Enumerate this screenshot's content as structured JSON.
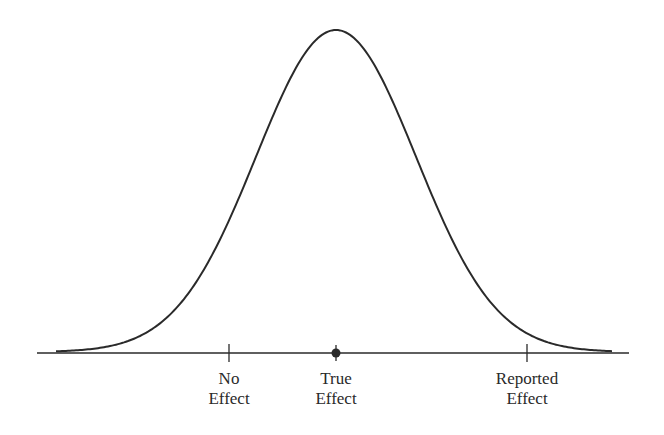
{
  "diagram": {
    "type": "normal-distribution-curve",
    "colors": {
      "line": "#2a2a2a",
      "background": "#ffffff"
    },
    "markers": [
      {
        "id": "no-effect",
        "line1": "No",
        "line2": "Effect",
        "style": "tick"
      },
      {
        "id": "true-effect",
        "line1": "True",
        "line2": "Effect",
        "style": "dot"
      },
      {
        "id": "reported-effect",
        "line1": "Reported",
        "line2": "Effect",
        "style": "tick"
      }
    ]
  }
}
